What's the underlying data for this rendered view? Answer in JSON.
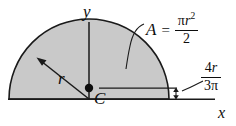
{
  "figure": {
    "shape": "semicircle",
    "fill_color": "#c9c9c9",
    "stroke_color": "#1a1a1a",
    "background_color": "#ffffff"
  },
  "axes": {
    "y_label": "y",
    "x_label": "x"
  },
  "annotations": {
    "radius_label": "r",
    "centroid_label": "C",
    "area": {
      "symbol": "A",
      "equals": "=",
      "numerator_pi": "π",
      "numerator_r": "r",
      "numerator_exponent": "2",
      "denominator": "2",
      "plain": "A = πr²/2"
    },
    "centroid_distance": {
      "numerator_coefficient": "4",
      "numerator_variable": "r",
      "denominator_coefficient": "3",
      "denominator_symbol": "π",
      "plain": "4r/3π"
    }
  },
  "geometry": {
    "center_x": 89,
    "baseline_y": 99,
    "radius": 80,
    "centroid_y": 88
  }
}
